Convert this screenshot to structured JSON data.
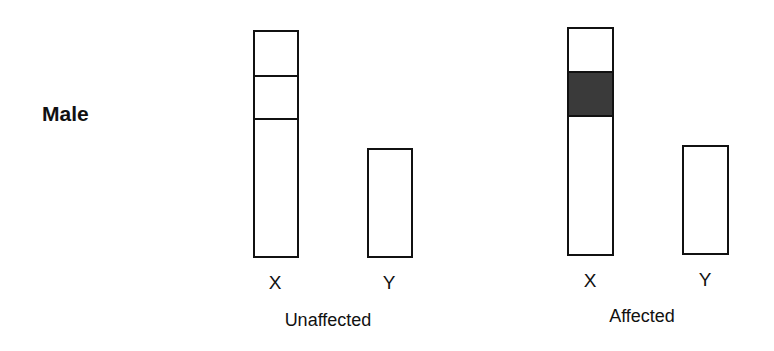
{
  "row_label": "Male",
  "groups": [
    {
      "label": "Unaffected",
      "chromosomes": [
        {
          "label": "X",
          "bands": [
            "plain",
            "plain",
            "plain"
          ]
        },
        {
          "label": "Y",
          "bands": [
            "plain"
          ]
        }
      ]
    },
    {
      "label": "Affected",
      "chromosomes": [
        {
          "label": "X",
          "bands": [
            "plain",
            "shaded",
            "plain"
          ]
        },
        {
          "label": "Y",
          "bands": [
            "plain"
          ]
        }
      ]
    }
  ],
  "colors": {
    "outline": "#111111",
    "shaded_band": "#3a3a3a",
    "background": "#ffffff"
  }
}
